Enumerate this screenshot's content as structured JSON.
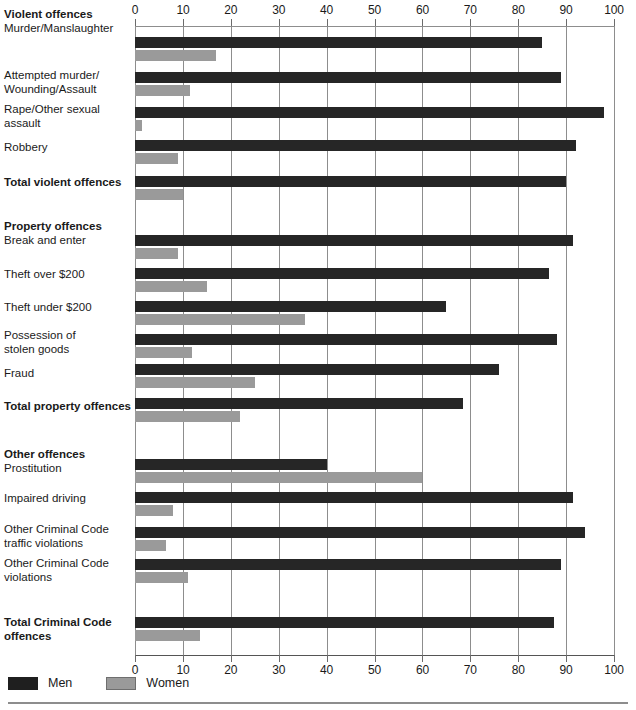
{
  "legend": {
    "items": [
      {
        "label": "Men",
        "color": "#1f1f1f",
        "key": "men"
      },
      {
        "label": "Women",
        "color": "#9a9a9a",
        "key": "women"
      }
    ]
  },
  "axis": {
    "ticks": [
      0,
      10,
      20,
      30,
      40,
      50,
      60,
      70,
      80,
      90,
      100
    ],
    "tick_labels": [
      "0",
      "10",
      "20",
      "30",
      "40",
      "50",
      "60",
      "70",
      "80",
      "90",
      "100"
    ]
  },
  "chart_data": {
    "type": "bar",
    "orientation": "horizontal",
    "title": "",
    "subtitle": "",
    "xlabel": "",
    "ylabel": "",
    "xlim": [
      0,
      100
    ],
    "grid": true,
    "legend_position": "bottom-left",
    "series": [
      {
        "name": "Men",
        "color": "#262626"
      },
      {
        "name": "Women",
        "color": "#9a9a9a"
      }
    ],
    "groups": [
      {
        "heading": "Violent offences",
        "rows": [
          {
            "label": "Murder/Manslaughter",
            "bold": false,
            "men": 85,
            "women": 17
          },
          {
            "label": "Attempted murder/\nWounding/Assault",
            "bold": false,
            "men": 89,
            "women": 11.5
          },
          {
            "label": "Rape/Other sexual\nassault",
            "bold": false,
            "men": 98,
            "women": 1.5
          },
          {
            "label": "Robbery",
            "bold": false,
            "men": 92,
            "women": 9
          },
          {
            "label": "Total violent offences",
            "bold": true,
            "men": 90,
            "women": 10
          }
        ]
      },
      {
        "heading": "Property offences",
        "rows": [
          {
            "label": "Break and enter",
            "bold": false,
            "men": 91.5,
            "women": 9
          },
          {
            "label": "Theft over $200",
            "bold": false,
            "men": 86.5,
            "women": 15
          },
          {
            "label": "Theft under $200",
            "bold": false,
            "men": 65,
            "women": 35.5
          },
          {
            "label": "Possession of\nstolen goods",
            "bold": false,
            "men": 88,
            "women": 12
          },
          {
            "label": "Fraud",
            "bold": false,
            "men": 76,
            "women": 25
          },
          {
            "label": "Total property offences",
            "bold": true,
            "men": 68.5,
            "women": 22
          }
        ]
      },
      {
        "heading": "Other offences",
        "rows": [
          {
            "label": "Prostitution",
            "bold": false,
            "men": 40,
            "women": 60
          },
          {
            "label": "Impaired driving",
            "bold": false,
            "men": 91.5,
            "women": 8
          },
          {
            "label": "Other Criminal Code\ntraffic violations",
            "bold": false,
            "men": 94,
            "women": 6.5
          },
          {
            "label": "Other Criminal Code\nviolations",
            "bold": false,
            "men": 89,
            "women": 11
          },
          {
            "label": "Total Criminal Code\noffences",
            "bold": true,
            "men": 87.5,
            "women": 13.5
          }
        ]
      }
    ]
  },
  "layout": {
    "rows": [
      {
        "label_top": 8,
        "heading_top": 8,
        "men_top": 37,
        "women_top": 50
      },
      {
        "label_top": 69,
        "heading_top": 0,
        "men_top": 72,
        "women_top": 85
      },
      {
        "label_top": 103,
        "heading_top": 0,
        "men_top": 107,
        "women_top": 120
      },
      {
        "label_top": 141,
        "heading_top": 0,
        "men_top": 140,
        "women_top": 153
      },
      {
        "label_top": 176,
        "heading_top": 0,
        "men_top": 176,
        "women_top": 189
      },
      {
        "label_top": 220,
        "heading_top": 220,
        "men_top": 235,
        "women_top": 248
      },
      {
        "label_top": 268,
        "heading_top": 0,
        "men_top": 268,
        "women_top": 281
      },
      {
        "label_top": 301,
        "heading_top": 0,
        "men_top": 301,
        "women_top": 314
      },
      {
        "label_top": 329,
        "heading_top": 0,
        "men_top": 334,
        "women_top": 347
      },
      {
        "label_top": 367,
        "heading_top": 0,
        "men_top": 364,
        "women_top": 377
      },
      {
        "label_top": 400,
        "heading_top": 0,
        "men_top": 398,
        "women_top": 411
      },
      {
        "label_top": 448,
        "heading_top": 448,
        "men_top": 459,
        "women_top": 472
      },
      {
        "label_top": 492,
        "heading_top": 0,
        "men_top": 492,
        "women_top": 505
      },
      {
        "label_top": 523,
        "heading_top": 0,
        "men_top": 527,
        "women_top": 540
      },
      {
        "label_top": 557,
        "heading_top": 0,
        "men_top": 559,
        "women_top": 572
      },
      {
        "label_top": 616,
        "heading_top": 0,
        "men_top": 617,
        "women_top": 630
      }
    ]
  }
}
